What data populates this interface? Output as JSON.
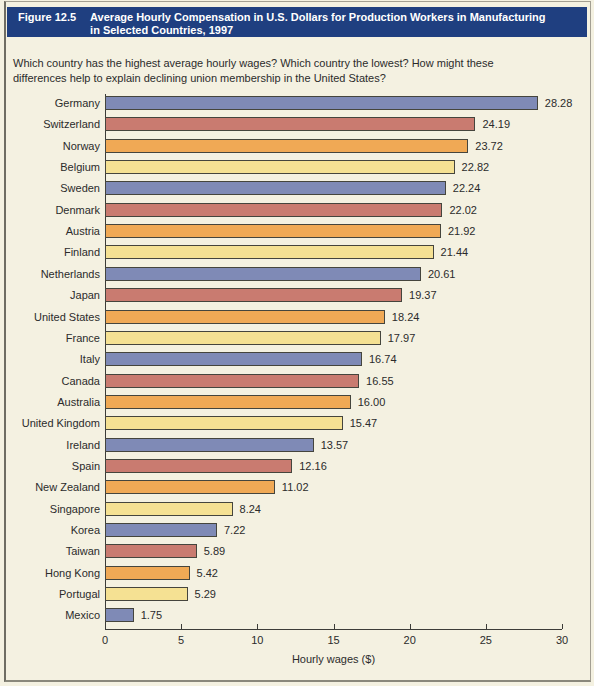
{
  "figure": {
    "label": "Figure 12.5",
    "title_line1": "Average Hourly Compensation in U.S. Dollars for Production Workers in Manufacturing",
    "title_line2": "in Selected Countries, 1997",
    "question_line1": "Which country has the highest average hourly wages? Which country the lowest? How might these",
    "question_line2": "differences help to explain declining union membership in the United States?"
  },
  "chart_data": {
    "type": "bar",
    "orientation": "horizontal",
    "title": "Average Hourly Compensation in U.S. Dollars for Production Workers in Manufacturing in Selected Countries, 1997",
    "categories": [
      "Germany",
      "Switzerland",
      "Norway",
      "Belgium",
      "Sweden",
      "Denmark",
      "Austria",
      "Finland",
      "Netherlands",
      "Japan",
      "United States",
      "France",
      "Italy",
      "Canada",
      "Australia",
      "United Kingdom",
      "Ireland",
      "Spain",
      "New Zealand",
      "Singapore",
      "Korea",
      "Taiwan",
      "Hong Kong",
      "Portugal",
      "Mexico"
    ],
    "values": [
      28.28,
      24.19,
      23.72,
      22.82,
      22.24,
      22.02,
      21.92,
      21.44,
      20.61,
      19.37,
      18.24,
      17.97,
      16.74,
      16.55,
      16.0,
      15.47,
      13.57,
      12.16,
      11.02,
      8.24,
      7.22,
      5.89,
      5.42,
      5.29,
      1.75
    ],
    "xlabel": "Hourly wages ($)",
    "xlim": [
      0,
      30
    ],
    "xticks": [
      0,
      5,
      10,
      15,
      20,
      25,
      30
    ],
    "grid": false,
    "legend": "none",
    "value_labels_shown": true,
    "bar_color_cycle": [
      "#7f8ab6",
      "#c97b70",
      "#f0a955",
      "#f5e193"
    ]
  },
  "colors": {
    "header_bg": "#1f3f80",
    "header_text": "#ffffff",
    "background": "#f4f1e1",
    "bar_border": "#45453d",
    "axis": "#3c3c38",
    "text": "#2b2b2b"
  }
}
